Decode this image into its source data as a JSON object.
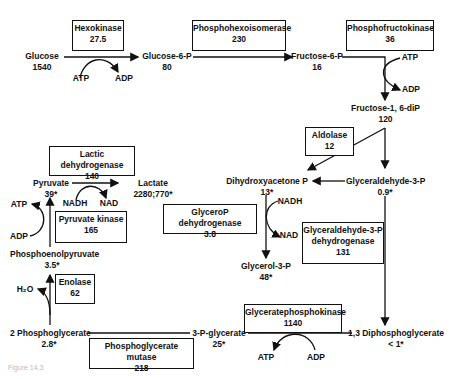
{
  "metabolites": {
    "glucose": {
      "name": "Glucose",
      "value": "1540"
    },
    "g6p": {
      "name": "Glucose-6-P",
      "value": "80"
    },
    "f6p": {
      "name": "Fructose-6-P",
      "value": "16"
    },
    "fdp": {
      "name": "Fructose-1, 6-diP",
      "value": "120"
    },
    "dhap": {
      "name": "Dihydroxyacetone P",
      "value": "13*"
    },
    "gap": {
      "name": "Glyceraldehyde-3-P",
      "value": "0.9*"
    },
    "g3p": {
      "name": "Glycerol-3-P",
      "value": "48*"
    },
    "bpg": {
      "name": "1,3 Diphosphoglycerate",
      "value": "< 1*"
    },
    "pg3": {
      "name": "3-P-glycerate",
      "value": "25*"
    },
    "pg2": {
      "name": "2 Phosphoglycerate",
      "value": "2.8*"
    },
    "pep": {
      "name": "Phosphoenolpyruvate",
      "value": "3.5*"
    },
    "pyruvate": {
      "name": "Pyruvate",
      "value": "39*"
    },
    "lactate": {
      "name": "Lactate",
      "value": "2280;770*"
    }
  },
  "enzymes": {
    "hexokinase": {
      "name": "Hexokinase",
      "value": "27.5"
    },
    "phi": {
      "name": "Phosphohexoisomerase",
      "value": "230"
    },
    "pfk": {
      "name": "Phosphofructokinase",
      "value": "36"
    },
    "aldolase": {
      "name": "Aldolase",
      "value": "12"
    },
    "gpdh": {
      "name": "GlyceroP dehydrogenase",
      "value": "3.8"
    },
    "gapdh": {
      "name1": "Glyceraldehyde-3-P",
      "name2": "dehydrogenase",
      "value": "131"
    },
    "pgk": {
      "name": "Glyceratephosphokinase",
      "value": "1140"
    },
    "pgm": {
      "name": "Phosphoglycerate mutase",
      "value": "218"
    },
    "enolase": {
      "name": "Enolase",
      "value": "62"
    },
    "pk": {
      "name": "Pyruvate kinase",
      "value": "165"
    },
    "ldh": {
      "name": "Lactic dehydrogenase",
      "value": "140"
    }
  },
  "cofactors": {
    "atp": "ATP",
    "adp": "ADP",
    "nadh": "NADH",
    "nad": "NAD",
    "h2o": "H₂O"
  },
  "caption": "Figure 14.3"
}
